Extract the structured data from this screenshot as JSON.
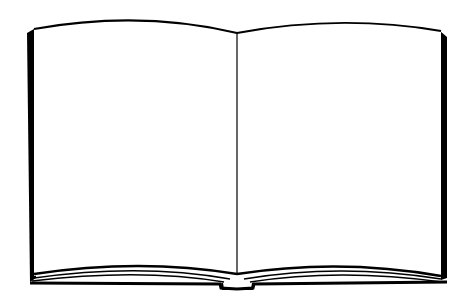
{
  "illustration": {
    "subject": "open-book",
    "description": "Blank open book line art",
    "colors": {
      "ink": "#000000",
      "page": "#ffffff",
      "background": "#ffffff"
    }
  }
}
